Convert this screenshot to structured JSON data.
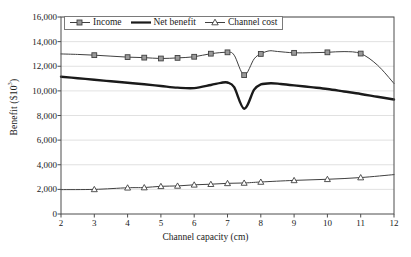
{
  "chart_data": {
    "type": "line",
    "title": "",
    "xlabel": "Channel capacity (cm)",
    "ylabel": "Benefit ($10",
    "ylabel_sup": "3",
    "ylabel_tail": ")",
    "xlim": [
      2,
      12
    ],
    "ylim": [
      0,
      16000
    ],
    "grid": true,
    "grid_color": "#d9d9d9",
    "legend_position": "top-left-inside",
    "xticks": [
      2,
      3,
      4,
      5,
      6,
      7,
      8,
      9,
      10,
      11,
      12
    ],
    "xtick_labels": [
      "2",
      "3",
      "4",
      "5",
      "6",
      "7",
      "8",
      "9",
      "10",
      "11",
      "12"
    ],
    "yticks": [
      0,
      2000,
      4000,
      6000,
      8000,
      10000,
      12000,
      14000,
      16000
    ],
    "ytick_labels": [
      "0",
      "2,000",
      "4,000",
      "6,000",
      "8,000",
      "10,000",
      "12,000",
      "14,000",
      "16,000"
    ],
    "series": [
      {
        "name": "Income",
        "marker": "square",
        "color": "#404040",
        "line_width": 1,
        "x": [
          2,
          2.5,
          3,
          3.5,
          4,
          4.5,
          5,
          5.5,
          6,
          6.5,
          7,
          7.2,
          7.5,
          7.8,
          8,
          8.25,
          8.5,
          9,
          9.5,
          10,
          10.5,
          11,
          11.5,
          12
        ],
        "values": [
          13000,
          12960,
          12900,
          12820,
          12740,
          12700,
          12630,
          12680,
          12770,
          13020,
          13130,
          12900,
          11280,
          12600,
          13000,
          13250,
          13200,
          13090,
          13100,
          13130,
          13190,
          13030,
          12100,
          10600
        ],
        "marker_x": [
          3,
          4,
          4.5,
          5,
          5.5,
          6,
          6.5,
          7,
          7.5,
          8,
          9,
          10,
          11
        ],
        "marker_values": [
          12900,
          12740,
          12700,
          12630,
          12680,
          12770,
          13020,
          13130,
          11280,
          13000,
          13090,
          13130,
          13030
        ]
      },
      {
        "name": "Net benefit",
        "marker": "none",
        "color": "#1a1a1a",
        "line_width": 2.4,
        "x": [
          2,
          2.5,
          3,
          3.5,
          4,
          4.5,
          5,
          5.5,
          6,
          6.5,
          6.8,
          7,
          7.2,
          7.5,
          7.8,
          8,
          8.3,
          8.6,
          9,
          9.5,
          10,
          10.5,
          11,
          11.5,
          12
        ],
        "values": [
          11150,
          11030,
          10900,
          10780,
          10660,
          10540,
          10400,
          10260,
          10220,
          10480,
          10650,
          10680,
          10300,
          8550,
          10100,
          10520,
          10620,
          10560,
          10450,
          10300,
          10150,
          9950,
          9750,
          9520,
          9300
        ]
      },
      {
        "name": "Channel cost",
        "marker": "triangle",
        "color": "#404040",
        "line_width": 1,
        "x": [
          2,
          3,
          4,
          4.5,
          5,
          5.5,
          6,
          6.5,
          7,
          7.5,
          8,
          9,
          10,
          11,
          12
        ],
        "values": [
          1980,
          2000,
          2130,
          2150,
          2250,
          2280,
          2370,
          2420,
          2490,
          2520,
          2600,
          2730,
          2820,
          2960,
          3200
        ],
        "marker_x": [
          3,
          4,
          4.5,
          5,
          5.5,
          6,
          6.5,
          7,
          7.5,
          8,
          9,
          10,
          11
        ],
        "marker_values": [
          2000,
          2130,
          2150,
          2250,
          2280,
          2370,
          2420,
          2490,
          2520,
          2600,
          2730,
          2820,
          2960
        ]
      }
    ]
  },
  "legend": {
    "items": [
      {
        "label": "Income",
        "marker": "square"
      },
      {
        "label": "Net benefit",
        "marker": "line"
      },
      {
        "label": "Channel cost",
        "marker": "triangle"
      }
    ]
  }
}
